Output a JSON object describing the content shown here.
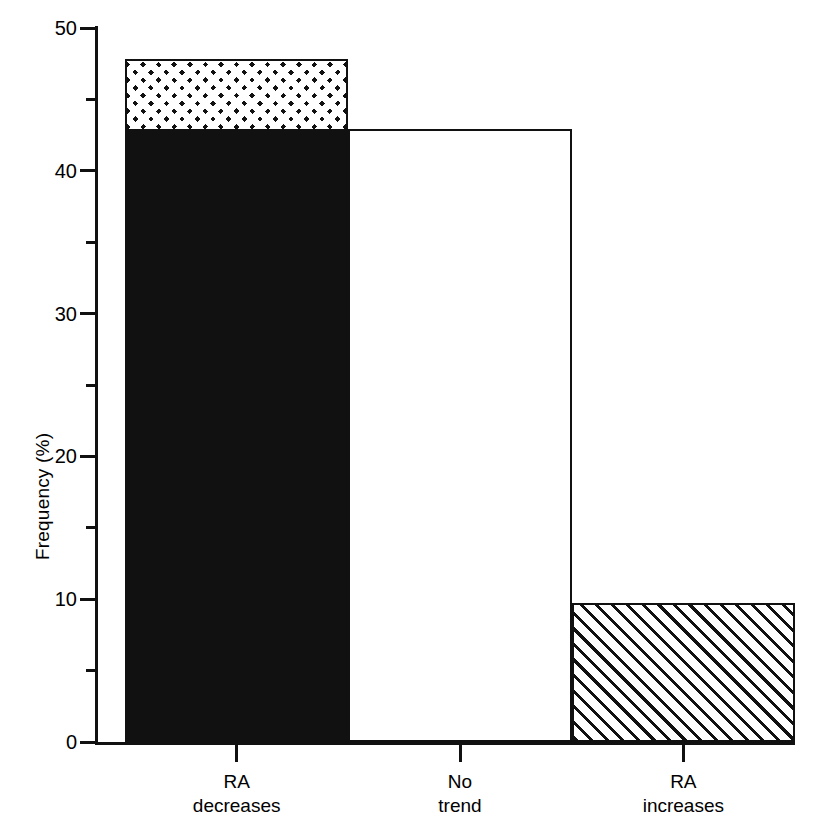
{
  "chart_data": {
    "type": "bar",
    "title": "",
    "xlabel": "",
    "ylabel": "Frequency (%)",
    "ylim": [
      0,
      50
    ],
    "grid": false,
    "legend": "none",
    "categories": [
      "RA\ndecreases",
      "No\ntrend",
      "RA\nincreases"
    ],
    "values": [
      47.8,
      42.9,
      9.7
    ],
    "series": [
      {
        "name": "Total frequency",
        "values": [
          47.8,
          42.9,
          9.7
        ]
      },
      {
        "name": "Significant portion (solid)",
        "values": [
          42.9,
          0,
          0
        ]
      },
      {
        "name": "Non-significant portion (cross-hatched cap)",
        "values": [
          4.9,
          0,
          0
        ]
      }
    ],
    "bar_styles": [
      "solid-black-with-crosshatch-cap",
      "open-white",
      "diagonal-hatch"
    ],
    "ytick_labels": [
      "0",
      "10",
      "20",
      "30",
      "40",
      "50"
    ],
    "ytick_values": [
      0,
      10,
      20,
      30,
      40,
      50
    ],
    "yminor_values": [
      5,
      15,
      25,
      35,
      45
    ]
  },
  "axes": {
    "y_label": "Frequency (%)",
    "y_ticks": [
      {
        "value": 0,
        "label": "0"
      },
      {
        "value": 10,
        "label": "10"
      },
      {
        "value": 20,
        "label": "20"
      },
      {
        "value": 30,
        "label": "30"
      },
      {
        "value": 40,
        "label": "40"
      },
      {
        "value": 50,
        "label": "50"
      }
    ],
    "y_minor_ticks": [
      5,
      15,
      25,
      35,
      45
    ],
    "x_ticks": [
      {
        "label": "RA\ndecreases"
      },
      {
        "label": "No\ntrend"
      },
      {
        "label": "RA\nincreases"
      }
    ]
  },
  "bars": [
    {
      "name": "ra-decreases",
      "label": "RA\ndecreases",
      "total": 47.8,
      "segments": [
        {
          "name": "solid",
          "from": 0,
          "to": 42.9,
          "style": "fill-solid"
        },
        {
          "name": "cross",
          "from": 42.9,
          "to": 47.8,
          "style": "fill-cross"
        }
      ]
    },
    {
      "name": "no-trend",
      "label": "No\ntrend",
      "total": 42.9,
      "segments": [
        {
          "name": "open",
          "from": 0,
          "to": 42.9,
          "style": "fill-none"
        }
      ]
    },
    {
      "name": "ra-increases",
      "label": "RA\nincreases",
      "total": 9.7,
      "segments": [
        {
          "name": "diagonal",
          "from": 0,
          "to": 9.7,
          "style": "fill-diag"
        }
      ]
    }
  ],
  "colors": {
    "ink": "#111111",
    "paper": "#ffffff"
  }
}
